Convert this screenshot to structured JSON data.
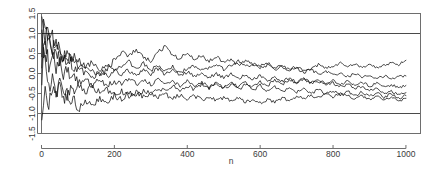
{
  "chart_data": {
    "type": "line",
    "title": "",
    "subtitle": "",
    "xlabel": "n",
    "ylabel": "",
    "xlim": [
      0,
      1040
    ],
    "ylim": [
      -1.5,
      1.5
    ],
    "grid": false,
    "legend": null,
    "xticks": [
      0,
      200,
      400,
      600,
      800,
      1000
    ],
    "xtick_labels": [
      "0",
      "200",
      "400",
      "600",
      "800",
      "1000"
    ],
    "yticks": [
      -1.5,
      -1.0,
      -0.5,
      0.0,
      0.5,
      1.0,
      1.5
    ],
    "ytick_labels": [
      "-1.5",
      "-1.0",
      "-0.5",
      "0.0",
      "0.5",
      "1.0",
      "1.5"
    ],
    "ytick_labels_rotated": true,
    "annotations": [
      {
        "kind": "hline",
        "y": 1.0,
        "label": "upper reference line"
      },
      {
        "kind": "hline",
        "y": -1.0,
        "label": "lower reference line"
      }
    ],
    "series": [
      {
        "name": "walk-1",
        "color": "#0d0d0d",
        "x": [
          1,
          10,
          20,
          30,
          40,
          50,
          60,
          70,
          80,
          90,
          100,
          120,
          140,
          160,
          180,
          200,
          220,
          240,
          260,
          280,
          300,
          320,
          340,
          360,
          380,
          400,
          420,
          440,
          460,
          480,
          500,
          520,
          540,
          560,
          580,
          600,
          620,
          640,
          660,
          680,
          700,
          720,
          740,
          760,
          780,
          800,
          820,
          840,
          860,
          880,
          900,
          920,
          940,
          960,
          980,
          1000
        ],
        "y": [
          1.3,
          0.88,
          1.05,
          0.62,
          0.84,
          0.55,
          0.4,
          0.58,
          0.33,
          0.45,
          0.22,
          0.12,
          0.05,
          -0.02,
          0.1,
          0.34,
          0.52,
          0.46,
          0.62,
          0.4,
          0.3,
          0.52,
          0.68,
          0.45,
          0.38,
          0.5,
          0.36,
          0.44,
          0.3,
          0.42,
          0.28,
          0.34,
          0.2,
          0.3,
          0.24,
          0.18,
          0.26,
          0.14,
          0.2,
          0.1,
          0.18,
          0.08,
          0.14,
          0.22,
          0.12,
          0.2,
          0.26,
          0.18,
          0.24,
          0.16,
          0.22,
          0.14,
          0.2,
          0.28,
          0.22,
          0.33
        ]
      },
      {
        "name": "walk-2",
        "color": "#0d0d0d",
        "x": [
          1,
          10,
          20,
          30,
          40,
          50,
          60,
          70,
          80,
          90,
          100,
          120,
          140,
          160,
          180,
          200,
          220,
          240,
          260,
          280,
          300,
          320,
          340,
          360,
          380,
          400,
          420,
          440,
          460,
          480,
          500,
          520,
          540,
          560,
          580,
          600,
          620,
          640,
          660,
          680,
          700,
          720,
          740,
          760,
          780,
          800,
          820,
          840,
          860,
          880,
          900,
          920,
          940,
          960,
          980,
          1000
        ],
        "y": [
          1.25,
          1.0,
          0.72,
          0.95,
          0.55,
          0.7,
          0.42,
          0.3,
          0.48,
          0.22,
          0.35,
          0.2,
          0.3,
          0.1,
          0.22,
          0.06,
          0.18,
          0.28,
          0.14,
          0.24,
          0.08,
          0.18,
          0.05,
          0.16,
          0.02,
          0.12,
          0.2,
          0.06,
          0.16,
          0.24,
          0.1,
          0.2,
          0.3,
          0.16,
          0.24,
          0.12,
          0.22,
          0.08,
          0.18,
          0.05,
          0.14,
          0.02,
          0.1,
          -0.02,
          0.06,
          -0.05,
          0.02,
          -0.08,
          0.0,
          -0.1,
          -0.04,
          -0.12,
          -0.06,
          -0.14,
          -0.08,
          -0.06
        ]
      },
      {
        "name": "walk-3",
        "color": "#0d0d0d",
        "x": [
          1,
          10,
          20,
          30,
          40,
          50,
          60,
          70,
          80,
          90,
          100,
          120,
          140,
          160,
          180,
          200,
          220,
          240,
          260,
          280,
          300,
          320,
          340,
          360,
          380,
          400,
          420,
          440,
          460,
          480,
          500,
          520,
          540,
          560,
          580,
          600,
          620,
          640,
          660,
          680,
          700,
          720,
          740,
          760,
          780,
          800,
          820,
          840,
          860,
          880,
          900,
          920,
          940,
          960,
          980,
          1000
        ],
        "y": [
          1.15,
          0.7,
          0.9,
          0.45,
          0.62,
          0.3,
          0.45,
          0.18,
          0.3,
          0.05,
          0.18,
          0.02,
          -0.1,
          0.04,
          -0.08,
          0.06,
          -0.04,
          0.08,
          -0.02,
          0.1,
          0.0,
          0.12,
          -0.02,
          0.08,
          -0.06,
          0.04,
          -0.08,
          0.02,
          -0.1,
          0.0,
          -0.12,
          -0.02,
          -0.14,
          -0.04,
          -0.16,
          -0.06,
          -0.18,
          -0.08,
          -0.2,
          -0.1,
          -0.22,
          -0.12,
          -0.24,
          -0.14,
          -0.26,
          -0.18,
          -0.28,
          -0.2,
          -0.3,
          -0.22,
          -0.32,
          -0.24,
          -0.34,
          -0.28,
          -0.36,
          -0.3
        ]
      },
      {
        "name": "walk-4",
        "color": "#0d0d0d",
        "x": [
          1,
          10,
          20,
          30,
          40,
          50,
          60,
          70,
          80,
          90,
          100,
          120,
          140,
          160,
          180,
          200,
          220,
          240,
          260,
          280,
          300,
          320,
          340,
          360,
          380,
          400,
          420,
          440,
          460,
          480,
          500,
          520,
          540,
          560,
          580,
          600,
          620,
          640,
          660,
          680,
          700,
          720,
          740,
          760,
          780,
          800,
          820,
          840,
          860,
          880,
          900,
          920,
          940,
          960,
          980,
          1000
        ],
        "y": [
          1.05,
          0.55,
          0.25,
          0.5,
          0.1,
          0.3,
          -0.05,
          0.15,
          -0.2,
          0.0,
          -0.25,
          -0.1,
          -0.3,
          -0.15,
          -0.32,
          -0.18,
          -0.3,
          -0.12,
          -0.26,
          -0.14,
          -0.28,
          -0.16,
          -0.3,
          -0.18,
          -0.32,
          -0.2,
          -0.34,
          -0.22,
          -0.36,
          -0.24,
          -0.38,
          -0.26,
          -0.4,
          -0.28,
          -0.42,
          -0.3,
          -0.44,
          -0.32,
          -0.46,
          -0.34,
          -0.48,
          -0.36,
          -0.5,
          -0.4,
          -0.52,
          -0.42,
          -0.54,
          -0.44,
          -0.56,
          -0.46,
          -0.58,
          -0.48,
          -0.6,
          -0.5,
          -0.62,
          -0.55
        ]
      },
      {
        "name": "walk-5",
        "color": "#0d0d0d",
        "x": [
          1,
          10,
          20,
          30,
          40,
          50,
          60,
          70,
          80,
          90,
          100,
          120,
          140,
          160,
          180,
          200,
          220,
          240,
          260,
          280,
          300,
          320,
          340,
          360,
          380,
          400,
          420,
          440,
          460,
          480,
          500,
          520,
          540,
          560,
          580,
          600,
          620,
          640,
          660,
          680,
          700,
          720,
          740,
          760,
          780,
          800,
          820,
          840,
          860,
          880,
          900,
          920,
          940,
          960,
          980,
          1000
        ],
        "y": [
          0.6,
          0.15,
          -0.35,
          -0.1,
          -0.55,
          -0.3,
          -0.7,
          -0.48,
          -0.82,
          -0.6,
          -0.92,
          -0.7,
          -0.8,
          -0.62,
          -0.74,
          -0.55,
          -0.66,
          -0.48,
          -0.58,
          -0.42,
          -0.5,
          -0.36,
          -0.46,
          -0.32,
          -0.42,
          -0.3,
          -0.4,
          -0.28,
          -0.38,
          -0.26,
          -0.36,
          -0.24,
          -0.34,
          -0.22,
          -0.32,
          -0.2,
          -0.3,
          -0.18,
          -0.28,
          -0.16,
          -0.26,
          -0.14,
          -0.24,
          -0.2,
          -0.28,
          -0.24,
          -0.32,
          -0.28,
          -0.36,
          -0.32,
          -0.42,
          -0.38,
          -0.48,
          -0.44,
          -0.52,
          -0.48
        ]
      },
      {
        "name": "walk-6",
        "color": "#0d0d0d",
        "x": [
          1,
          10,
          20,
          30,
          40,
          50,
          60,
          70,
          80,
          90,
          100,
          120,
          140,
          160,
          180,
          200,
          220,
          240,
          260,
          280,
          300,
          320,
          340,
          360,
          380,
          400,
          420,
          440,
          460,
          480,
          500,
          520,
          540,
          560,
          580,
          600,
          620,
          640,
          660,
          680,
          700,
          720,
          740,
          760,
          780,
          800,
          820,
          840,
          860,
          880,
          900,
          920,
          940,
          960,
          980,
          1000
        ],
        "y": [
          -1.0,
          -0.45,
          -0.72,
          -0.3,
          -0.55,
          -0.22,
          -0.44,
          -0.58,
          -0.36,
          -0.5,
          -0.3,
          -0.44,
          -0.34,
          -0.48,
          -0.4,
          -0.52,
          -0.44,
          -0.56,
          -0.46,
          -0.58,
          -0.5,
          -0.6,
          -0.52,
          -0.62,
          -0.54,
          -0.64,
          -0.56,
          -0.66,
          -0.58,
          -0.68,
          -0.6,
          -0.7,
          -0.62,
          -0.72,
          -0.64,
          -0.74,
          -0.66,
          -0.7,
          -0.62,
          -0.66,
          -0.58,
          -0.62,
          -0.55,
          -0.6,
          -0.52,
          -0.58,
          -0.5,
          -0.56,
          -0.62,
          -0.56,
          -0.64,
          -0.58,
          -0.66,
          -0.6,
          -0.68,
          -0.62
        ]
      }
    ]
  }
}
